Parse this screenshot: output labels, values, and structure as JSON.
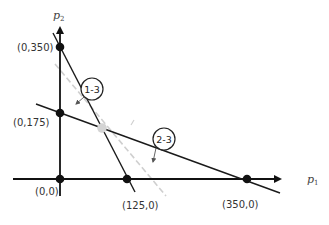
{
  "diagram": {
    "axes": {
      "x_label": "p",
      "x_label_sub": "1",
      "y_label": "p",
      "y_label_sub": "2"
    },
    "points": [
      {
        "label": "(0,350)",
        "type": "vertex"
      },
      {
        "label": "(0,175)",
        "type": "vertex"
      },
      {
        "label": "(0,0)",
        "type": "vertex"
      },
      {
        "label": "(125,0)",
        "type": "vertex"
      },
      {
        "label": "(350,0)",
        "type": "vertex"
      }
    ],
    "lines": [
      {
        "label": "1-3",
        "from": "(0,350)",
        "to": "(125,0)"
      },
      {
        "label": "2-3",
        "from": "(0,175)",
        "to": "(350,0)"
      }
    ],
    "intersection": {
      "label": "",
      "color": "#cccccc"
    },
    "dashed_line_color": "#cccccc",
    "line_color": "#222222"
  }
}
